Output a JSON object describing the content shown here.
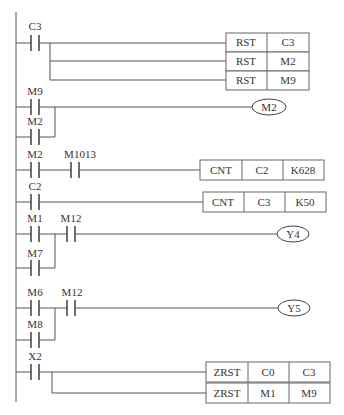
{
  "diagram": {
    "type": "PLC ladder diagram",
    "rungs": [
      {
        "id": 1,
        "contacts": [
          {
            "label": "C3"
          }
        ],
        "outputs": [
          {
            "kind": "instruction",
            "cells": [
              "RST",
              "C3"
            ]
          },
          {
            "kind": "instruction",
            "cells": [
              "RST",
              "M2"
            ]
          },
          {
            "kind": "instruction",
            "cells": [
              "RST",
              "M9"
            ]
          }
        ]
      },
      {
        "id": 2,
        "contacts": [
          {
            "label": "M9"
          }
        ],
        "parallel": [
          {
            "label": "M2"
          }
        ],
        "outputs": [
          {
            "kind": "coil",
            "label": "M2"
          }
        ]
      },
      {
        "id": 3,
        "contacts": [
          {
            "label": "M2"
          },
          {
            "label": "M1013"
          }
        ],
        "outputs": [
          {
            "kind": "instruction",
            "cells": [
              "CNT",
              "C2",
              "K628"
            ]
          }
        ]
      },
      {
        "id": 4,
        "contacts": [
          {
            "label": "C2"
          }
        ],
        "outputs": [
          {
            "kind": "instruction",
            "cells": [
              "CNT",
              "C3",
              "K50"
            ]
          }
        ]
      },
      {
        "id": 5,
        "contacts": [
          {
            "label": "M1"
          },
          {
            "label": "M12"
          }
        ],
        "parallel": [
          {
            "label": "M7"
          }
        ],
        "outputs": [
          {
            "kind": "coil",
            "label": "Y4"
          }
        ]
      },
      {
        "id": 6,
        "contacts": [
          {
            "label": "M6"
          },
          {
            "label": "M12"
          }
        ],
        "parallel": [
          {
            "label": "M8"
          }
        ],
        "outputs": [
          {
            "kind": "coil",
            "label": "Y5"
          }
        ]
      },
      {
        "id": 7,
        "contacts": [
          {
            "label": "X2"
          }
        ],
        "outputs": [
          {
            "kind": "instruction",
            "cells": [
              "ZRST",
              "C0",
              "C3"
            ]
          },
          {
            "kind": "instruction",
            "cells": [
              "ZRST",
              "M1",
              "M9"
            ]
          }
        ]
      }
    ]
  }
}
